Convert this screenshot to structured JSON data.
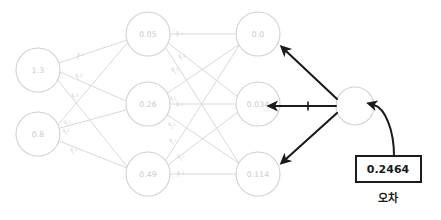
{
  "diagram": {
    "style": "hand-drawn pencil sketch",
    "colors": {
      "network_stroke": "#d0d0d0",
      "network_text": "#c9c9c9",
      "edge_label": "#d8d8d8",
      "arrow_stroke": "#1b1b1b",
      "box_stroke": "#1b1b1b",
      "background": "#ffffff"
    }
  },
  "layers": {
    "input": {
      "name": "input-layer",
      "nodes": [
        {
          "id": "i1",
          "value": "1.3",
          "cx": 38,
          "cy": 70,
          "r": 22
        },
        {
          "id": "i2",
          "value": "0.8",
          "cx": 38,
          "cy": 134,
          "r": 22
        }
      ]
    },
    "hidden": {
      "name": "hidden-layer",
      "nodes": [
        {
          "id": "h1",
          "value": "0.05",
          "cx": 148,
          "cy": 34,
          "r": 22
        },
        {
          "id": "h2",
          "value": "0.26",
          "cx": 148,
          "cy": 104,
          "r": 22
        },
        {
          "id": "h3",
          "value": "0.49",
          "cx": 148,
          "cy": 174,
          "r": 22
        }
      ]
    },
    "output": {
      "name": "output-layer",
      "nodes": [
        {
          "id": "o1",
          "value": "0.0",
          "cx": 258,
          "cy": 34,
          "r": 22
        },
        {
          "id": "o2",
          "value": "0.034",
          "cx": 258,
          "cy": 104,
          "r": 22
        },
        {
          "id": "o3",
          "value": "0.114",
          "cx": 258,
          "cy": 174,
          "r": 22
        }
      ]
    },
    "loss_node": {
      "name": "loss-node",
      "value": "",
      "cx": 355,
      "cy": 106,
      "r": 19
    }
  },
  "edge_labels": {
    "input_to_hidden": [
      {
        "id": "i1-h1",
        "text": "0.1",
        "x": 81,
        "y": 55
      },
      {
        "id": "i1-h2",
        "text": "0.2",
        "x": 79,
        "y": 76
      },
      {
        "id": "i1-h3",
        "text": "0.3",
        "x": 75,
        "y": 96
      },
      {
        "id": "i2-h1",
        "text": "0.1",
        "x": 67,
        "y": 123
      },
      {
        "id": "i2-h2",
        "text": "0.2",
        "x": 66,
        "y": 131
      },
      {
        "id": "i2-h3",
        "text": "0.1",
        "x": 74,
        "y": 150
      }
    ],
    "hidden_to_output": [
      {
        "id": "h1-o1",
        "text": "0.1",
        "x": 180,
        "y": 34
      },
      {
        "id": "h1-o2",
        "text": "0.2",
        "x": 182,
        "y": 57
      },
      {
        "id": "h1-o3",
        "text": "0.3",
        "x": 175,
        "y": 70
      },
      {
        "id": "h2-o1",
        "text": "0.1",
        "x": 173,
        "y": 99
      },
      {
        "id": "h2-o2",
        "text": "0.1",
        "x": 180,
        "y": 105
      },
      {
        "id": "h2-o3",
        "text": "0.1",
        "x": 172,
        "y": 125
      },
      {
        "id": "h3-o1",
        "text": "0.1",
        "x": 173,
        "y": 141
      },
      {
        "id": "h3-o2",
        "text": "0.2",
        "x": 181,
        "y": 157
      },
      {
        "id": "h3-o3",
        "text": "0.1",
        "x": 181,
        "y": 174
      }
    ]
  },
  "backprop_arrows": [
    {
      "id": "arrow-to-o1",
      "from": "loss-node",
      "to": "o1",
      "direction": "up-left"
    },
    {
      "id": "arrow-to-o2",
      "from": "loss-node",
      "to": "o2",
      "direction": "left"
    },
    {
      "id": "arrow-to-o3",
      "from": "loss-node",
      "to": "o3",
      "direction": "down-left"
    }
  ],
  "loss_box": {
    "name": "loss-value-box",
    "value": "0.2464",
    "caption": "오차",
    "x": 356,
    "y": 156,
    "width": 65,
    "height": 26
  }
}
